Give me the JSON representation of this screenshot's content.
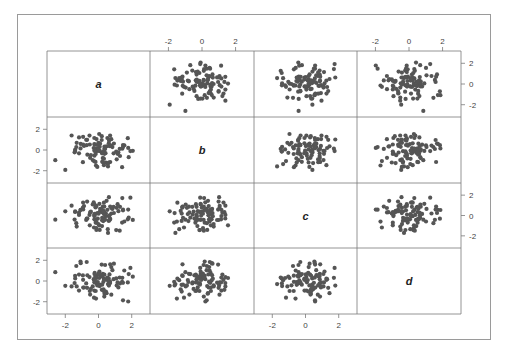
{
  "chart_data": {
    "type": "scatter",
    "subtype": "scatterplot-matrix",
    "title": "",
    "variables": [
      "a",
      "b",
      "c",
      "d"
    ],
    "tick_labels": [
      "-2",
      "0",
      "2"
    ],
    "tick_values": [
      -2,
      0,
      2
    ],
    "axis_range": [
      -2.8,
      2.8
    ],
    "grid": false,
    "legend": null,
    "top_axis_columns": [
      1,
      3
    ],
    "bottom_axis_columns": [
      0,
      2
    ],
    "left_axis_rows": [
      1,
      3
    ],
    "right_axis_rows": [
      0,
      2
    ],
    "point_color": "#555555",
    "n_points_per_variable": 100,
    "seed": 7
  },
  "colors": {
    "frame": "#9a9a9a",
    "grid": "#7a7a7a",
    "text": "#444444",
    "point": "#555555"
  }
}
